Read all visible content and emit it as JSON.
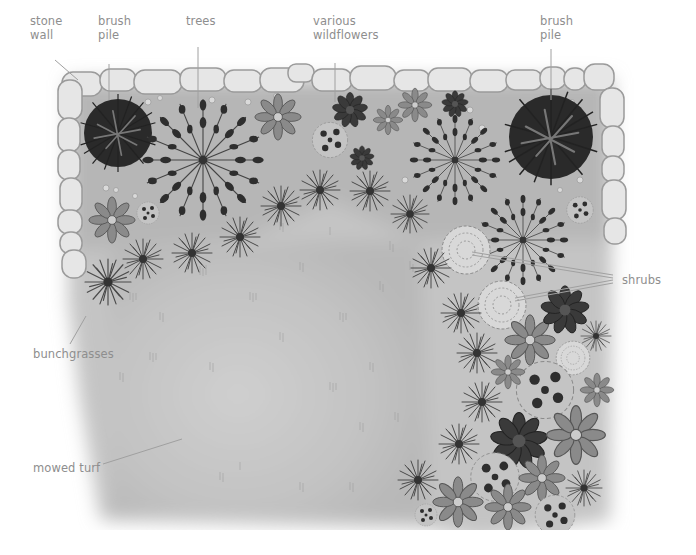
{
  "diagram": {
    "style": "grayscale watercolor illustration, top-down view",
    "colors": {
      "label_text": "#8e8e8e",
      "leader_line": "#9a9a9a",
      "ground": "#bdbdbd",
      "turf": "#c9c9c9",
      "stone_fill": "#e4e4e4",
      "stone_outline": "#9a9a9a",
      "brush_pile": "#2a2a2a",
      "tree": "#3a3a3a",
      "grass": "#555555",
      "shrub_outline": "#8a8a8a"
    },
    "labels": [
      {
        "id": "stone-wall",
        "text": "stone\nwall",
        "x": 30,
        "y": 14
      },
      {
        "id": "brush-pile-left",
        "text": "brush\npile",
        "x": 98,
        "y": 14
      },
      {
        "id": "trees",
        "text": "trees",
        "x": 186,
        "y": 14
      },
      {
        "id": "various-wildflowers",
        "text": "various\nwildflowers",
        "x": 313,
        "y": 14
      },
      {
        "id": "brush-pile-right",
        "text": "brush\npile",
        "x": 540,
        "y": 14
      },
      {
        "id": "shrubs",
        "text": "shrubs",
        "x": 622,
        "y": 275
      },
      {
        "id": "bunchgrasses",
        "text": "bunchgrasses",
        "x": 33,
        "y": 347
      },
      {
        "id": "mowed-turf",
        "text": "mowed turf",
        "x": 33,
        "y": 461
      }
    ]
  }
}
